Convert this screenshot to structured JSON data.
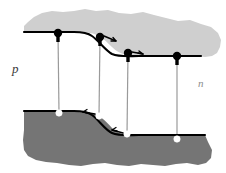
{
  "figure": {
    "width": 226,
    "height": 173,
    "background": "#ffffff"
  },
  "labels": {
    "p_region": "p",
    "n_region": "n"
  },
  "colors": {
    "conduction_band_fill": "#cfcfcf",
    "valence_band_fill": "#757575",
    "band_edge_line": "#000000",
    "electron_fill": "#000000",
    "hole_fill": "#ffffff",
    "tie_line": "#9a9a9a",
    "background": "#ffffff"
  },
  "bands": {
    "conduction": {
      "name": "conduction-band",
      "edge_label": "Ec",
      "left_energy_y": 32,
      "right_energy_y": 56,
      "step_start_x": 85,
      "step_end_x": 140,
      "fill": "#cfcfcf"
    },
    "valence": {
      "name": "valence-band",
      "edge_label": "Ev",
      "left_energy_y": 111,
      "right_energy_y": 134,
      "step_start_x": 85,
      "step_end_x": 140,
      "fill": "#757575"
    }
  },
  "carriers": {
    "electrons": [
      {
        "id": "electron-1",
        "x": 58,
        "y": 33,
        "has_arrow": false,
        "arrow_dx": 0,
        "arrow_dy": 0
      },
      {
        "id": "electron-2",
        "x": 100,
        "y": 37,
        "has_arrow": true,
        "arrow_dx": 13,
        "arrow_dy": 4
      },
      {
        "id": "electron-3",
        "x": 128,
        "y": 53,
        "has_arrow": true,
        "arrow_dx": 12,
        "arrow_dy": 2
      },
      {
        "id": "electron-4",
        "x": 177,
        "y": 56,
        "has_arrow": false,
        "arrow_dx": 0,
        "arrow_dy": 0
      }
    ],
    "holes": [
      {
        "id": "hole-1",
        "x": 59,
        "y": 113,
        "has_arrow": false,
        "arrow_dx": 0,
        "arrow_dy": 0
      },
      {
        "id": "hole-2",
        "x": 99,
        "y": 116,
        "has_arrow": true,
        "arrow_dx": -13,
        "arrow_dy": -2
      },
      {
        "id": "hole-3",
        "x": 127,
        "y": 134,
        "has_arrow": true,
        "arrow_dx": -12,
        "arrow_dy": -2
      },
      {
        "id": "hole-4",
        "x": 177,
        "y": 139,
        "has_arrow": false,
        "arrow_dx": 0,
        "arrow_dy": 0
      }
    ]
  },
  "tie_lines": [
    {
      "id": "tie-line-1",
      "x_top": 58,
      "y_top": 33,
      "x_bottom": 59,
      "y_bottom": 113
    },
    {
      "id": "tie-line-2",
      "x_top": 100,
      "y_top": 37,
      "x_bottom": 99,
      "y_bottom": 116
    },
    {
      "id": "tie-line-3",
      "x_top": 128,
      "y_top": 53,
      "x_bottom": 127,
      "y_bottom": 134
    },
    {
      "id": "tie-line-4",
      "x_top": 177,
      "y_top": 56,
      "x_bottom": 177,
      "y_bottom": 139
    }
  ]
}
